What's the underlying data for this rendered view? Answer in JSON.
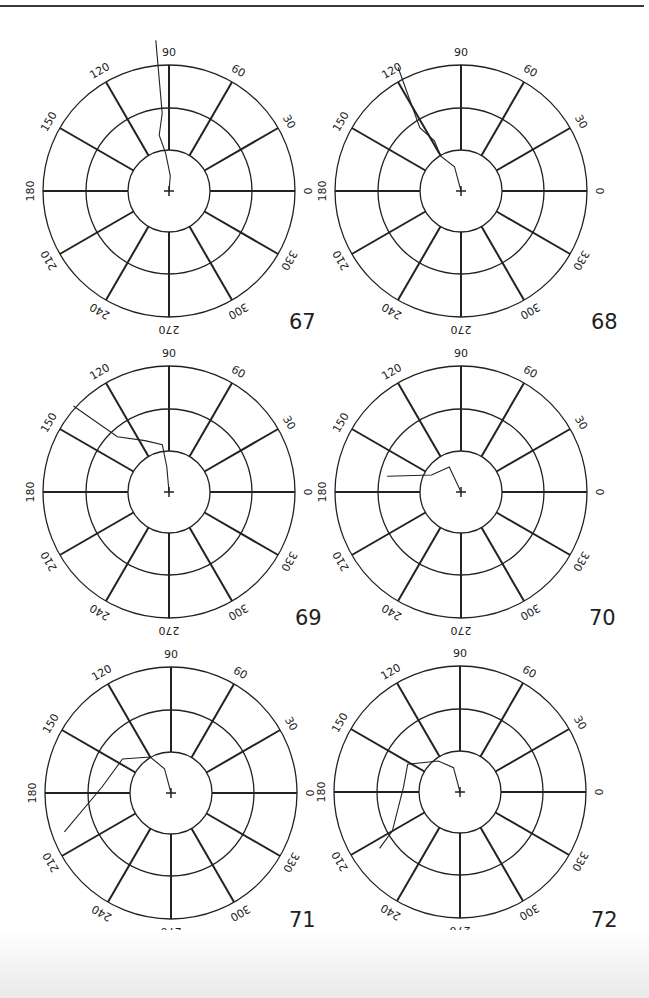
{
  "page": {
    "width": 649,
    "height": 998,
    "background": "#ffffff",
    "ink": "#222222"
  },
  "angle_labels": [
    "0",
    "30",
    "60",
    "90",
    "120",
    "150",
    "180",
    "210",
    "240",
    "270",
    "300",
    "330"
  ],
  "chart_data": [
    {
      "type": "polar-track",
      "title": "67",
      "angular_labels": [
        0,
        30,
        60,
        90,
        120,
        150,
        180,
        210,
        240,
        270,
        300,
        330
      ],
      "rings": 3,
      "grid": true,
      "track": [
        [
          0.0,
          0
        ],
        [
          0.12,
          85
        ],
        [
          0.3,
          95
        ],
        [
          0.45,
          100
        ],
        [
          0.62,
          95
        ],
        [
          1.2,
          95
        ]
      ]
    },
    {
      "type": "polar-track",
      "title": "68",
      "angular_labels": [
        0,
        30,
        60,
        90,
        120,
        150,
        180,
        210,
        240,
        270,
        300,
        330
      ],
      "rings": 3,
      "grid": true,
      "track": [
        [
          0.0,
          0
        ],
        [
          0.2,
          105
        ],
        [
          0.32,
          120
        ],
        [
          0.45,
          118
        ],
        [
          0.6,
          123
        ],
        [
          1.1,
          117
        ]
      ]
    },
    {
      "type": "polar-track",
      "title": "69",
      "angular_labels": [
        0,
        30,
        60,
        90,
        120,
        150,
        180,
        210,
        240,
        270,
        300,
        330
      ],
      "rings": 3,
      "grid": true,
      "track": [
        [
          0.0,
          0
        ],
        [
          0.2,
          95
        ],
        [
          0.38,
          98
        ],
        [
          0.45,
          115
        ],
        [
          0.6,
          133
        ],
        [
          1.02,
          138
        ]
      ]
    },
    {
      "type": "polar-track",
      "title": "70",
      "angular_labels": [
        0,
        30,
        60,
        90,
        120,
        150,
        180,
        210,
        240,
        270,
        300,
        330
      ],
      "rings": 3,
      "grid": true,
      "track": [
        [
          0.0,
          0
        ],
        [
          0.22,
          115
        ],
        [
          0.27,
          150
        ],
        [
          0.6,
          168
        ]
      ]
    },
    {
      "type": "polar-track",
      "title": "71",
      "angular_labels": [
        0,
        30,
        60,
        90,
        120,
        150,
        180,
        210,
        240,
        270,
        300,
        330
      ],
      "rings": 3,
      "grid": true,
      "track": [
        [
          0.0,
          0
        ],
        [
          0.2,
          105
        ],
        [
          0.33,
          120
        ],
        [
          0.47,
          145
        ],
        [
          0.55,
          175
        ],
        [
          0.9,
          200
        ]
      ]
    },
    {
      "type": "polar-track",
      "title": "72",
      "angular_labels": [
        0,
        30,
        60,
        90,
        120,
        150,
        180,
        210,
        240,
        270,
        300,
        330
      ],
      "rings": 3,
      "grid": true,
      "track": [
        [
          0.0,
          0
        ],
        [
          0.2,
          105
        ],
        [
          0.3,
          125
        ],
        [
          0.47,
          152
        ],
        [
          0.45,
          175
        ],
        [
          0.62,
          210
        ],
        [
          0.78,
          215
        ]
      ]
    }
  ]
}
